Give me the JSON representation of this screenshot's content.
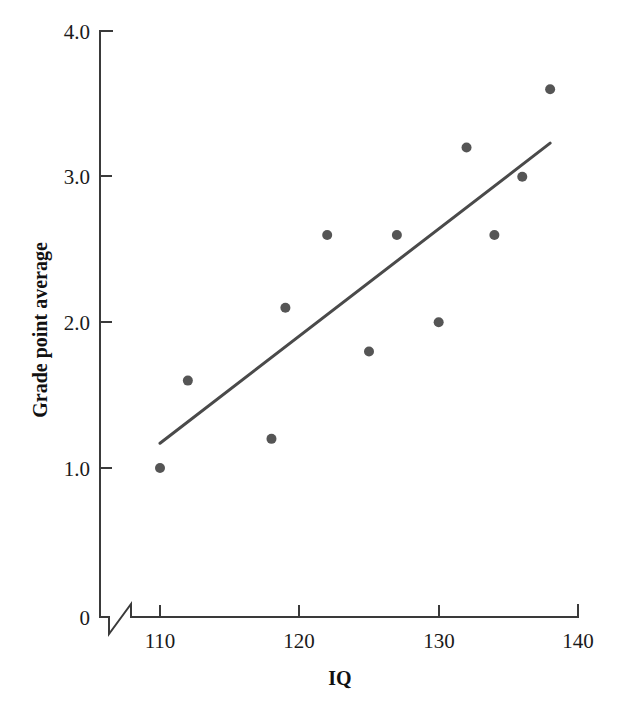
{
  "chart_data": {
    "type": "scatter",
    "title": "",
    "xlabel": "IQ",
    "ylabel": "Grade point average",
    "xlim": [
      110,
      140
    ],
    "ylim": [
      0,
      4.0
    ],
    "grid": false,
    "legend": null,
    "x_ticks": [
      "110",
      "120",
      "130",
      "140"
    ],
    "x_tick_values": [
      110,
      120,
      130,
      140
    ],
    "y_ticks": [
      "0",
      "1.0",
      "2.0",
      "3.0",
      "4.0"
    ],
    "y_tick_values": [
      0,
      1.0,
      2.0,
      3.0,
      4.0
    ],
    "axis_break": {
      "axis": "x",
      "note": "zigzag break between origin 0 and first tick 110"
    },
    "points": [
      {
        "x": 110,
        "y": 1.0
      },
      {
        "x": 112,
        "y": 1.6
      },
      {
        "x": 118,
        "y": 1.2
      },
      {
        "x": 119,
        "y": 2.1
      },
      {
        "x": 122,
        "y": 2.6
      },
      {
        "x": 125,
        "y": 1.8
      },
      {
        "x": 127,
        "y": 2.6
      },
      {
        "x": 130,
        "y": 2.0
      },
      {
        "x": 132,
        "y": 3.2
      },
      {
        "x": 134,
        "y": 2.6
      },
      {
        "x": 136,
        "y": 3.0
      },
      {
        "x": 138,
        "y": 3.6
      }
    ],
    "trend_line": {
      "x0": 110,
      "y0": 1.17,
      "x1": 138,
      "y1": 3.23
    },
    "colors": {
      "point": "#555555",
      "trend_line": "#4a4a4a",
      "axis": "#3a3a3a",
      "text": "#1a1a1a",
      "background": "#ffffff"
    }
  }
}
